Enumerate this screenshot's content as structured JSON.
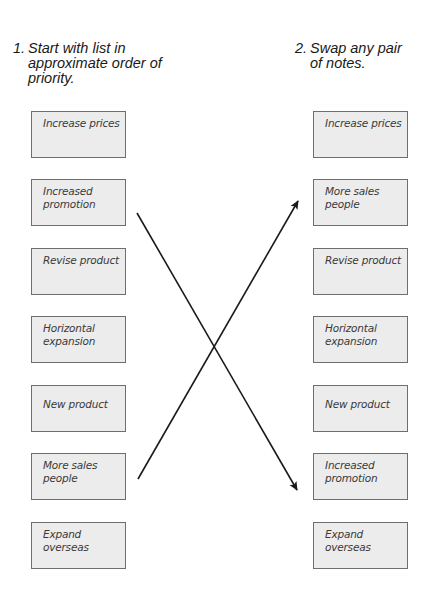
{
  "headings": {
    "left": {
      "number": "1.",
      "text": "Start with list in approximate order of priority."
    },
    "right": {
      "number": "2.",
      "text": "Swap any pair of notes."
    }
  },
  "left_column": {
    "notes": [
      {
        "text": "Increase prices"
      },
      {
        "text": "Increased promotion"
      },
      {
        "text": "Revise product"
      },
      {
        "text": "Horizontal expansion"
      },
      {
        "text": "New product"
      },
      {
        "text": "More sales people"
      },
      {
        "text": "Expand overseas"
      }
    ]
  },
  "right_column": {
    "notes": [
      {
        "text": "Increase prices"
      },
      {
        "text": "More sales people"
      },
      {
        "text": "Revise product"
      },
      {
        "text": "Horizontal expansion"
      },
      {
        "text": "New product"
      },
      {
        "text": "Increased promotion"
      },
      {
        "text": "Expand overseas"
      }
    ]
  },
  "arrows": [
    {
      "from": "Increased promotion (left, position 2)",
      "to": "Increased promotion (right, position 6)"
    },
    {
      "from": "More sales people (left, position 6)",
      "to": "More sales people (right, position 2)"
    }
  ],
  "colors": {
    "note_fill": "#ececec",
    "note_border": "#6e6e6e",
    "arrow": "#1a1a1a",
    "text": "#1a1a1a"
  }
}
